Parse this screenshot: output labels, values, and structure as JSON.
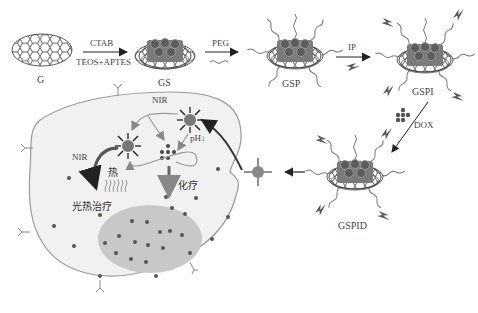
{
  "synthesis": {
    "stages": [
      {
        "id": "G",
        "label": "G"
      },
      {
        "id": "GS",
        "label": "GS"
      },
      {
        "id": "GSP",
        "label": "GSP"
      },
      {
        "id": "GSPI",
        "label": "GSPI"
      },
      {
        "id": "GSPID",
        "label": "GSPID"
      }
    ],
    "steps": [
      {
        "from": "G",
        "to": "GS",
        "reagent_top": "CTAB",
        "reagent_bottom": "TEOS+APTES"
      },
      {
        "from": "GS",
        "to": "GSP",
        "reagent_top": "PEG"
      },
      {
        "from": "GSP",
        "to": "GSPI",
        "reagent_top": "IP"
      },
      {
        "from": "GSPI",
        "to": "GSPID",
        "reagent_top": "DOX"
      }
    ]
  },
  "cell": {
    "labels": {
      "nir_top": "NIR",
      "nir_left": "NIR",
      "ph": "pH↓",
      "heat": "热",
      "photothermal": "光热治疗",
      "chemo": "化疗"
    }
  },
  "colors": {
    "cell_fill": "#f1f1f1",
    "cell_stroke": "#9a9a9a",
    "nucleus_fill": "#c8c8c8",
    "dot": "#555555",
    "arrow": "#333333"
  }
}
